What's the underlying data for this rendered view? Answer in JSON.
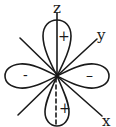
{
  "diagram": {
    "type": "d-orbital lobe diagram",
    "axes": {
      "z": {
        "label": "z"
      },
      "y": {
        "label": "y"
      },
      "x": {
        "label": "x"
      }
    },
    "lobes": {
      "top": {
        "sign": "+"
      },
      "bottom": {
        "sign": "+"
      },
      "left": {
        "sign": "-"
      },
      "right": {
        "sign": "–"
      }
    },
    "colors": {
      "stroke": "#1a1a1a",
      "background": "#ffffff"
    }
  }
}
